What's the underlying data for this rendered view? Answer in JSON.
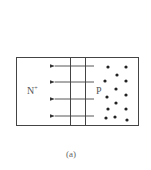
{
  "diagram": {
    "regions": [
      {
        "name": "N-plus region",
        "label": "N",
        "superscript": "+"
      },
      {
        "name": "P region",
        "label": "P"
      }
    ],
    "field_arrows": {
      "count": 4,
      "direction": "left"
    },
    "depletion_boundaries": 2,
    "p_dots_count": 14,
    "caption": "(a)",
    "colors": {
      "line": "#333333",
      "dot": "#222222",
      "text": "#555555"
    }
  }
}
